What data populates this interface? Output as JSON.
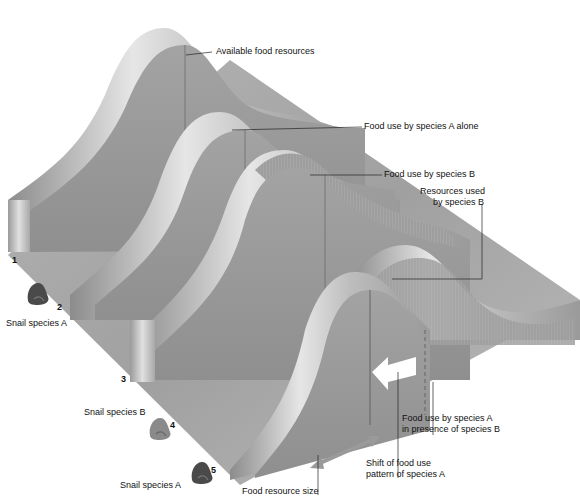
{
  "slices": [
    {
      "id": "1",
      "label": "1",
      "description": "Available food resources"
    },
    {
      "id": "2",
      "label": "2",
      "description": "Food use by species A alone",
      "species": "Snail species A"
    },
    {
      "id": "3",
      "label": "3",
      "description": "Food use by species B"
    },
    {
      "id": "4",
      "label": "4",
      "species": "Snail species B"
    },
    {
      "id": "5",
      "label": "5",
      "species": "Snail species A"
    }
  ],
  "labels": {
    "available_food": "Available food resources",
    "food_use_a_alone": "Food use by species A alone",
    "food_use_b": "Food use by species B",
    "resources_used_b_line1": "Resources used",
    "resources_used_b_line2": "by species B",
    "food_use_a_presence_line1": "Food use by species A",
    "food_use_a_presence_line2": "in presence of species B",
    "shift_line1": "Shift of food use",
    "shift_line2": "pattern of species A",
    "food_resource_size": "Food resource size",
    "snail_a_top": "Snail species A",
    "snail_b": "Snail species B",
    "snail_a_bottom": "Snail species A"
  },
  "numbers": {
    "n1": "1",
    "n2": "2",
    "n3": "3",
    "n4": "4",
    "n5": "5"
  },
  "colors": {
    "surface": "#9a9a9a",
    "surface_light": "#d8d8d8",
    "surface_dark": "#7d7d7d",
    "snail_a": "#4a4a4a",
    "snail_b": "#8a8a8a",
    "arrow": "#ffffff",
    "double_arrow": "#9a9a9a"
  }
}
